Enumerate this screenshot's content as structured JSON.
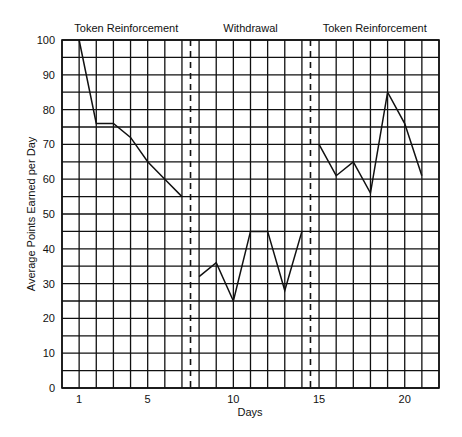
{
  "chart_data": {
    "type": "line",
    "title": "",
    "xlabel": "Days",
    "ylabel": "Average Points Earned per Day",
    "xlim": [
      0,
      22
    ],
    "ylim": [
      0,
      100
    ],
    "grid": true,
    "x_ticks": [
      1,
      5,
      10,
      15,
      20
    ],
    "y_ticks": [
      0,
      10,
      20,
      30,
      40,
      50,
      60,
      70,
      80,
      90,
      100
    ],
    "y_grid_step": 5,
    "x_grid_step": 1,
    "phases": [
      {
        "label": "Token Reinforcement",
        "start": 0,
        "end": 7.5
      },
      {
        "label": "Withdrawal",
        "start": 7.5,
        "end": 14.5
      },
      {
        "label": "Token Reinforcement",
        "start": 14.5,
        "end": 22
      }
    ],
    "phase_dividers": [
      7.5,
      14.5
    ],
    "series": [
      {
        "name": "Token Reinforcement (A1)",
        "x": [
          1,
          2,
          3,
          4,
          5,
          6,
          7
        ],
        "values": [
          100,
          76,
          76,
          72,
          65,
          60,
          55
        ]
      },
      {
        "name": "Withdrawal (B)",
        "x": [
          8,
          9,
          10,
          11,
          12,
          13,
          14
        ],
        "values": [
          32,
          36,
          25,
          45,
          45,
          28,
          45
        ]
      },
      {
        "name": "Token Reinforcement (A2)",
        "x": [
          15,
          16,
          17,
          18,
          19,
          20,
          21
        ],
        "values": [
          70,
          61,
          65,
          56,
          85,
          76,
          61
        ]
      }
    ],
    "legend": null
  },
  "colors": {
    "line": "#111111",
    "grid": "#111111",
    "background": "#ffffff"
  }
}
